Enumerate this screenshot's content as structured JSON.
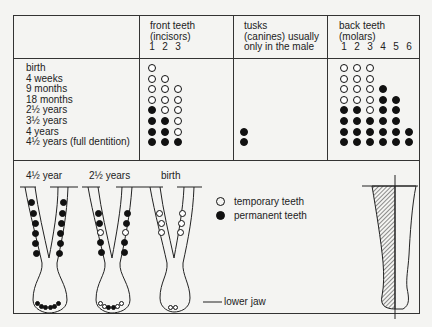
{
  "table": {
    "headers": {
      "incisors": {
        "line1": "front teeth",
        "line2": "(incisors)",
        "numbers": [
          "1",
          "2",
          "3"
        ]
      },
      "canines": {
        "line1": "tusks",
        "line2": "(canines) usually",
        "line3": "only in the male"
      },
      "molars": {
        "line1": "back teeth",
        "line2": "(molars)",
        "numbers": [
          "1",
          "2",
          "3",
          "4",
          "5",
          "6"
        ]
      }
    },
    "ages": [
      "birth",
      "4 weeks",
      "9 months",
      "18 months",
      "2½ years",
      "3½ years",
      "4 years",
      "4½ years (full dentition)"
    ],
    "tooth_key": "Each column lists per-age state: null = absent, 't' = temporary, 'p' = permanent",
    "incisors": [
      [
        "t",
        "t",
        "t",
        "t",
        "p",
        "p",
        "p",
        "p"
      ],
      [
        null,
        "t",
        "t",
        "t",
        "t",
        "p",
        "p",
        "p"
      ],
      [
        null,
        null,
        "t",
        "t",
        "t",
        "t",
        "t",
        "p"
      ]
    ],
    "canines": [
      [
        null,
        null,
        null,
        null,
        null,
        null,
        "p",
        "p"
      ]
    ],
    "molars": [
      [
        "t",
        "t",
        "t",
        "t",
        "p",
        "p",
        "p",
        "p"
      ],
      [
        "t",
        "t",
        "t",
        "t",
        "p",
        "p",
        "p",
        "p"
      ],
      [
        "t",
        "t",
        "t",
        "t",
        "t",
        "p",
        "p",
        "p"
      ],
      [
        null,
        null,
        "p",
        "p",
        "p",
        "p",
        "p",
        "p"
      ],
      [
        null,
        null,
        null,
        "p",
        "p",
        "p",
        "p",
        "p"
      ],
      [
        null,
        null,
        null,
        null,
        null,
        null,
        "p",
        "p"
      ]
    ]
  },
  "jaws": {
    "labels": [
      "4½ year",
      "2½ years",
      "birth"
    ],
    "lower_jaw_label": "lower jaw"
  },
  "legend": {
    "temporary": "temporary teeth",
    "permanent": "permanent teeth"
  },
  "colors": {
    "ink": "#111111",
    "paper": "#f4f4f2"
  }
}
